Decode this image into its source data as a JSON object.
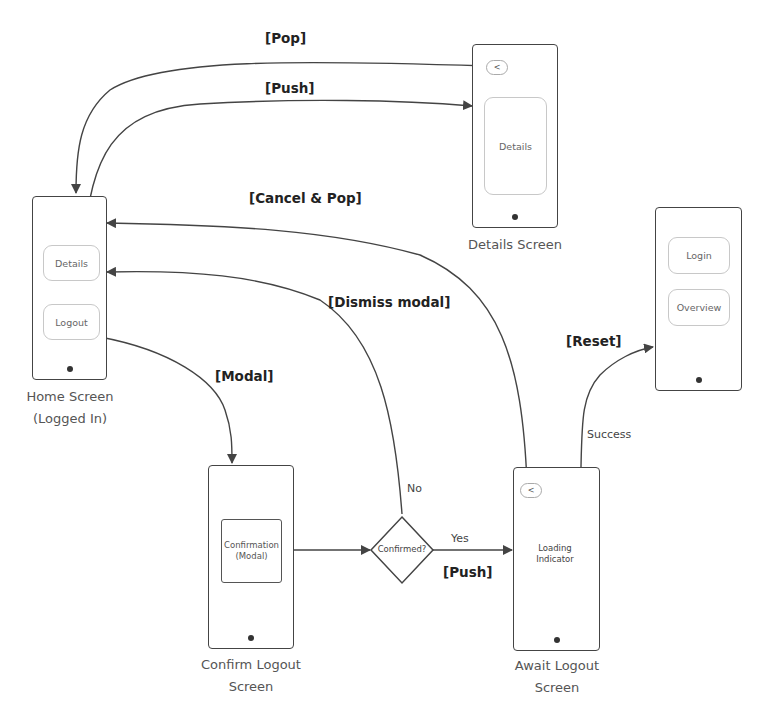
{
  "diagram": {
    "type": "navigation-flow",
    "screens": {
      "home": {
        "caption_line1": "Home Screen",
        "caption_line2": "(Logged In)",
        "buttons": [
          "Details",
          "Logout"
        ]
      },
      "details": {
        "caption": "Details Screen",
        "back_label": "<",
        "content": "Details"
      },
      "confirm_logout": {
        "caption_line1": "Confirm Logout",
        "caption_line2": "Screen",
        "modal_line1": "Confirmation",
        "modal_line2": "(Modal)"
      },
      "await_logout": {
        "caption_line1": "Await Logout",
        "caption_line2": "Screen",
        "back_label": "<",
        "loading_line1": "Loading",
        "loading_line2": "Indicator"
      },
      "logged_out": {
        "buttons": [
          "Login",
          "Overview"
        ]
      }
    },
    "decision": {
      "label": "Confirmed?",
      "yes_label": "Yes",
      "no_label": "No"
    },
    "edges": {
      "pop": "[Pop]",
      "push_details": "[Push]",
      "cancel_pop": "[Cancel & Pop]",
      "dismiss_modal": "[Dismiss modal]",
      "modal": "[Modal]",
      "push_await": "[Push]",
      "reset": "[Reset]",
      "success": "Success"
    }
  }
}
